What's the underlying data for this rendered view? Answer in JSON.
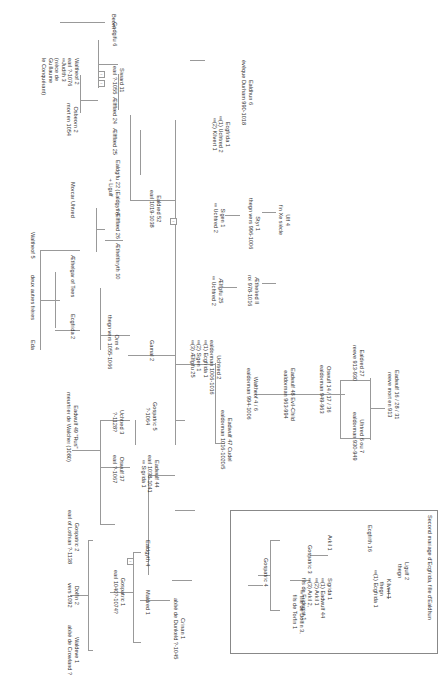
{
  "diagram": {
    "type": "genealogy-tree",
    "orientation": "rotated-90-clockwise",
    "inset_title": "Second mariage d'Ecgfrida, fille d'Ealdhun",
    "nodes": {
      "beorn": [
        "Beorn"
      ],
      "godgifu": [
        "Godgifu 6"
      ],
      "siward": [
        "Siward 11",
        "earl ?-1055"
      ],
      "aelfflaed24": [
        "Ælfflæd 24"
      ],
      "aelfflaed25": [
        "Ælfflæd 25"
      ],
      "waltheof2": [
        "Waltheof 2",
        "earl ?-1076",
        "∞Judith 3",
        "(nièce de",
        "Guillaume",
        "le Conquérant)"
      ],
      "osbeorn": [
        "Osbeorn 2",
        "mort en 1054"
      ],
      "ealdgifu22": [
        "Ealdgifu 22 (Ealdgyth)",
        "+ Ligulf"
      ],
      "morcar": [
        "Morcar Uhtred"
      ],
      "ealdhun": [
        "Ealdhun 6",
        "évêque Durham 990-1018"
      ],
      "ecgfrida1": [
        "Ecgfrida 1",
        "∞(1) Uchtred 2",
        "∞(2) Kilvert 1"
      ],
      "ulf": [
        "Ulf 4",
        "fin Xe siècle"
      ],
      "styr": [
        "Styr 1",
        "thegn vers 996-1006"
      ],
      "sige": [
        "Sigen 1",
        "∞ Uchtred 2"
      ],
      "aethelred": [
        "Æthelred II",
        "roi 978-1016"
      ],
      "aelfgifu25": [
        "Ælfgifu 25",
        "∞ Uchtred 2"
      ],
      "ealdred52": [
        "Ealdred 52",
        "earl 1019-1038"
      ],
      "aelfflaed26": [
        "Ælfflæd 26"
      ],
      "aethelthryth": [
        "Æthelthryth 10"
      ],
      "waltheof5": [
        "Waltheof 5"
      ],
      "deux_freres": [
        "deux autres frères"
      ],
      "eda": [
        "Eda"
      ],
      "aethelgar": [
        "Æthelgar of Tees"
      ],
      "ecgfrida2": [
        "Ecgfrida 2"
      ],
      "orm": [
        "Orm 4",
        "thegn vers 1055-1066"
      ],
      "gamal": [
        "Gamal 2"
      ],
      "uhtred2": [
        "Uchtred 2",
        "ealdorman 1006-1016",
        "∞(1) Ecgfrida 1",
        "∞(2) Sigen 1",
        "∞(3) Ælfgifu 25"
      ],
      "eadwulf47": [
        "Eadwulf 47 Cudel",
        "ealdorman 1016-1020/5"
      ],
      "waltheof4": [
        "Waltheof 4 / 6",
        "ealdorman 994-1006"
      ],
      "eadwulf48": [
        "Eadwulf 48 Evil-Child",
        "ealdorman 963-994"
      ],
      "oswulf14": [
        "Oswulf 14 / 17 / 36",
        "ealdorman 949-963"
      ],
      "ealdred27": [
        "Ealdred 27",
        "reeve 913-930"
      ],
      "uhtred6": [
        "Uhtred 6 ou 7",
        "ealdorman 930-949"
      ],
      "eadwulf16": [
        "Eadwulf 16 / 28 / 31",
        "reeve mort en 913"
      ],
      "gospatric5": [
        "Gospatric 5",
        "?-1064"
      ],
      "eadwulf44": [
        "Eadwulf 44",
        "earl 1038-1041",
        "∞ Sigrida 1"
      ],
      "uhtred3": [
        "Uchtred 3",
        "?-1128?"
      ],
      "oswulf37": [
        "Oswulf 37",
        "earl ?-1067"
      ],
      "eadwulf49": [
        "Eadwulf 49 \"Rus\"",
        "meurtrier de Walcher (1080)"
      ],
      "ealdgyth4": [
        "Ealdgyth 4"
      ],
      "maldred": [
        "Maldred 1"
      ],
      "crinan": [
        "Crinan 1",
        "abbé de Dunkeld ?-1045"
      ],
      "gospatric1": [
        "Gospatric 1",
        "earl 1040?-1074?"
      ],
      "gospatric2": [
        "Gospatric 2",
        "earl of Lothian ?-1138"
      ],
      "dolfin2": [
        "Dolfin 2",
        "vers 1092"
      ],
      "waldeve": [
        "Waldeve 1",
        "abbé de Crowland ?"
      ],
      "ligulf2": [
        "Ligulf 2",
        "thegn"
      ],
      "kilvert": [
        "Kilvert 1",
        "thegn",
        "∞(1) Ecgfrida 1"
      ],
      "ecgfrith16": [
        "Ecgfrith 16"
      ],
      "arkil": [
        "Arkil 1"
      ],
      "sigrida": [
        "Sigrida 1",
        "∞(1) Eadwulf 44",
        "∞(2) Arkil 1",
        "∞(3) Arkil 2,",
        "fils de Fridegist 1"
      ],
      "gospatric3": [
        "Gospatric 3",
        "∞ fille de Dolfin 3,",
        "fils de Torfin 1"
      ],
      "gospatric4": [
        "Gospatric 4"
      ]
    }
  }
}
